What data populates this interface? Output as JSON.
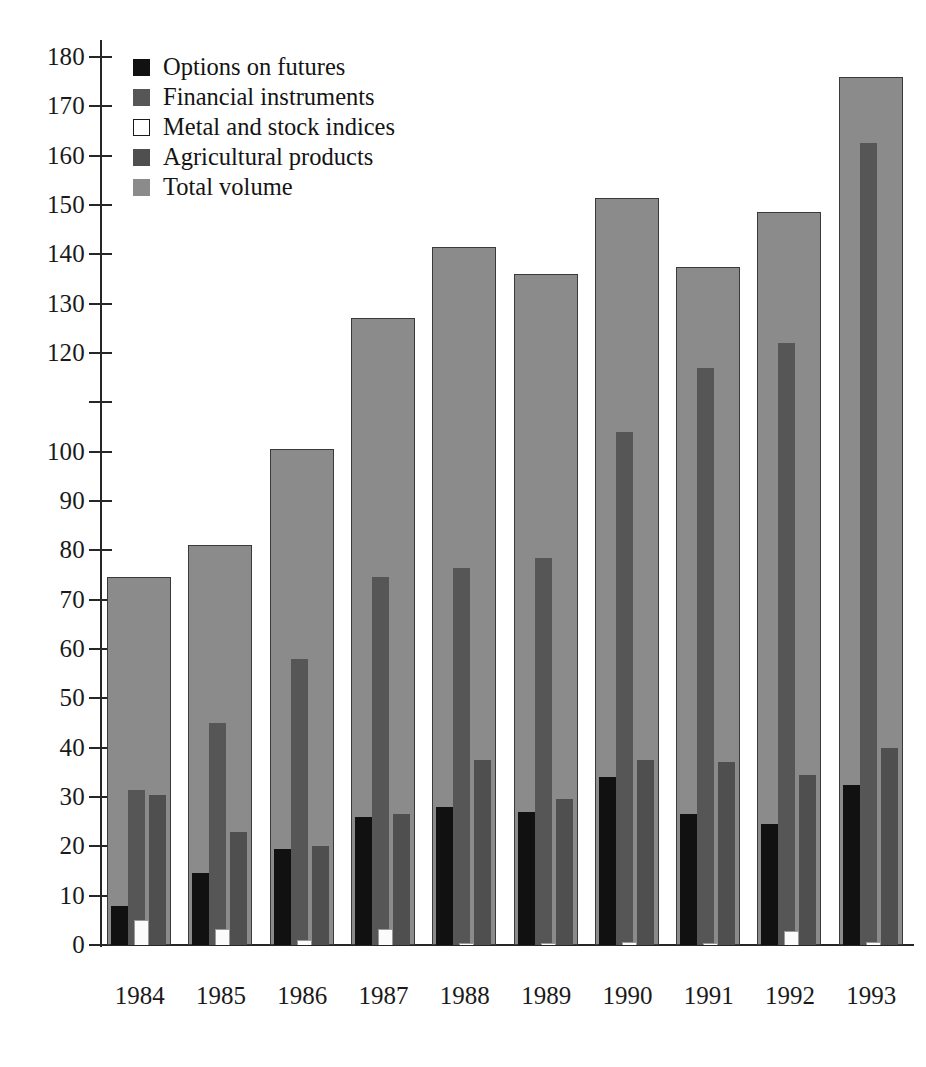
{
  "chart_data": {
    "type": "bar",
    "title": "",
    "subtitle": "",
    "xlabel": "",
    "ylabel": "",
    "grid": false,
    "legend_position": "top-left",
    "categories": [
      "1984",
      "1985",
      "1986",
      "1987",
      "1988",
      "1989",
      "1990",
      "1991",
      "1992",
      "1993"
    ],
    "ylim": [
      0,
      180
    ],
    "yticks": [
      0,
      10,
      20,
      30,
      40,
      50,
      60,
      70,
      80,
      90,
      100,
      110,
      120,
      130,
      140,
      150,
      160,
      170,
      180
    ],
    "ytick_labels": [
      "0",
      "10",
      "20",
      "30",
      "40",
      "50",
      "60",
      "70",
      "80",
      "90",
      "100",
      "",
      "120",
      "130",
      "140",
      "150",
      "160",
      "170",
      "180"
    ],
    "series": [
      {
        "name": "Options on futures",
        "color": "#111111",
        "values": [
          8.0,
          14.5,
          19.5,
          26.0,
          28.0,
          27.0,
          34.0,
          26.5,
          24.5,
          32.5
        ]
      },
      {
        "name": "Financial instruments",
        "color": "#565656",
        "values": [
          31.5,
          45.0,
          58.0,
          74.5,
          76.5,
          78.5,
          104.0,
          117.0,
          122.0,
          162.5
        ]
      },
      {
        "name": "Metal and stock indices",
        "color": "#ffffff",
        "values": [
          5.0,
          3.2,
          1.0,
          3.2,
          0.5,
          0.5,
          0.7,
          0.5,
          2.8,
          0.7
        ]
      },
      {
        "name": "Agricultural products",
        "color": "#4f4f4f",
        "values": [
          30.5,
          23.0,
          20.0,
          26.5,
          37.5,
          29.5,
          37.5,
          37.0,
          34.5,
          40.0
        ]
      },
      {
        "name": "Total volume",
        "color": "#8b8b8b",
        "values": [
          74.5,
          81.0,
          100.5,
          127.0,
          141.5,
          136.0,
          151.5,
          137.5,
          148.5,
          176.0
        ]
      }
    ]
  },
  "legend": {
    "entries": [
      {
        "label": "Options on futures",
        "swatch": "sw-options"
      },
      {
        "label": "Financial instruments",
        "swatch": "sw-financial"
      },
      {
        "label": "Metal and stock indices",
        "swatch": "sw-metal"
      },
      {
        "label": "Agricultural products",
        "swatch": "sw-agricultural"
      },
      {
        "label": "Total volume",
        "swatch": "sw-total"
      }
    ]
  },
  "colors": {
    "background": "#ffffff",
    "axis": "#262626",
    "text": "#1a1a1a",
    "options": "#111111",
    "financial": "#565656",
    "metal": "#ffffff",
    "agricultural": "#4f4f4f",
    "total": "#8b8b8b"
  }
}
